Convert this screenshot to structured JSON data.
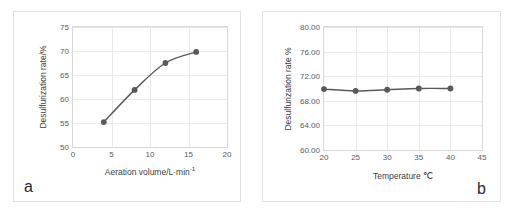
{
  "figure": {
    "panels": [
      {
        "label": "a"
      },
      {
        "label": "b"
      }
    ]
  },
  "chart_data": [
    {
      "type": "line",
      "panel": "a",
      "title": "",
      "xlabel": "Aeration volume/L·min",
      "xlabel_sup": "-1",
      "ylabel": "Desulfurization rate/%",
      "x": [
        4,
        8,
        12,
        16
      ],
      "values": [
        55.2,
        61.9,
        67.5,
        69.8
      ],
      "xlim": [
        0,
        20
      ],
      "ylim": [
        50,
        75
      ],
      "xticks": [
        0,
        5,
        10,
        15,
        20
      ],
      "yticks": [
        50,
        55,
        60,
        65,
        70,
        75
      ],
      "xticklabels": [
        "0",
        "5",
        "10",
        "15",
        "20"
      ],
      "yticklabels": [
        "50",
        "55",
        "60",
        "65",
        "70",
        "75"
      ],
      "grid": true,
      "legend": "none",
      "marker": "circle",
      "line_color": "#595959",
      "marker_color": "#595959"
    },
    {
      "type": "line",
      "panel": "b",
      "title": "",
      "xlabel": "Temperature ℃",
      "xlabel_sup": "",
      "ylabel": "Desulfurization rate %",
      "x": [
        20,
        25,
        30,
        35,
        40
      ],
      "values": [
        69.9,
        69.6,
        69.8,
        70.0,
        70.0
      ],
      "xlim": [
        20,
        45
      ],
      "ylim": [
        60.0,
        80.0
      ],
      "xticks": [
        20,
        25,
        30,
        35,
        40,
        45
      ],
      "yticks": [
        60.0,
        64.0,
        68.0,
        72.0,
        76.0,
        80.0
      ],
      "xticklabels": [
        "20",
        "25",
        "30",
        "35",
        "40",
        "45"
      ],
      "yticklabels": [
        "60.00",
        "64.00",
        "68.00",
        "72.00",
        "76.00",
        "80.00"
      ],
      "grid": true,
      "legend": "none",
      "marker": "circle",
      "line_color": "#595959",
      "marker_color": "#595959"
    }
  ]
}
